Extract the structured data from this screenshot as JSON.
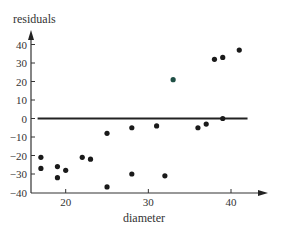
{
  "chart_data": {
    "type": "scatter",
    "title": "",
    "xlabel": "diameter",
    "ylabel": "residuals",
    "xlim": [
      15.8,
      41.0
    ],
    "ylim": [
      -40,
      45
    ],
    "x_ticks": [
      20,
      30,
      40
    ],
    "x_tick_labels": [
      "20",
      "30",
      "40"
    ],
    "y_ticks": [
      40,
      30,
      20,
      10,
      0,
      -10,
      -20,
      -30,
      -40
    ],
    "y_tick_labels": [
      "40",
      "30",
      "20",
      "10",
      "0",
      "−10",
      "−20",
      "−30",
      "−40"
    ],
    "grid": false,
    "legend": null,
    "reference_line": {
      "y": 0,
      "x_start": 16.6,
      "x_end": 42.0
    },
    "series": [
      {
        "name": "residuals",
        "color": "#1a1a1a",
        "points": [
          {
            "x": 17,
            "y": -21
          },
          {
            "x": 17,
            "y": -27
          },
          {
            "x": 19,
            "y": -26
          },
          {
            "x": 19,
            "y": -32
          },
          {
            "x": 20,
            "y": -28
          },
          {
            "x": 22,
            "y": -21
          },
          {
            "x": 23,
            "y": -22
          },
          {
            "x": 25,
            "y": -8
          },
          {
            "x": 25,
            "y": -37
          },
          {
            "x": 28,
            "y": -5
          },
          {
            "x": 28,
            "y": -30
          },
          {
            "x": 31,
            "y": -4
          },
          {
            "x": 32,
            "y": -31
          },
          {
            "x": 33,
            "y": 21,
            "color": "#1f4f45"
          },
          {
            "x": 36,
            "y": -5
          },
          {
            "x": 37,
            "y": -3
          },
          {
            "x": 38,
            "y": 32
          },
          {
            "x": 39,
            "y": 0
          },
          {
            "x": 39,
            "y": 33
          },
          {
            "x": 41,
            "y": 37
          }
        ]
      }
    ]
  },
  "colors": {
    "axis": "#333333",
    "zero_line": "#222222",
    "point": "#1a1a1a",
    "highlight_point": "#1f4f45",
    "text": "#333333"
  }
}
